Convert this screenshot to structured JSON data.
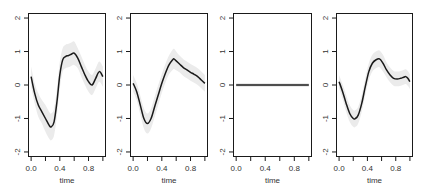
{
  "chart_data": [
    {
      "type": "line",
      "panel": 1,
      "title": "",
      "xlabel": "time",
      "ylabel": "",
      "xlim": [
        0,
        1
      ],
      "ylim": [
        -2,
        2
      ],
      "x_ticks": [
        0.0,
        0.2,
        0.4,
        0.6,
        0.8,
        1.0
      ],
      "x_tick_labels": [
        "0.0",
        "",
        "0.4",
        "",
        "0.8",
        ""
      ],
      "y_ticks": [
        -2,
        -1,
        0,
        1,
        2
      ],
      "y_tick_labels": [
        "-2",
        "-1",
        "0",
        "1",
        "2"
      ],
      "grid": false,
      "series": [
        {
          "name": "mean",
          "x": [
            0.0,
            0.05,
            0.1,
            0.15,
            0.2,
            0.25,
            0.28,
            0.32,
            0.36,
            0.4,
            0.44,
            0.48,
            0.52,
            0.56,
            0.6,
            0.65,
            0.7,
            0.75,
            0.8,
            0.85,
            0.9,
            0.95,
            1.0
          ],
          "values": [
            0.25,
            -0.25,
            -0.6,
            -0.8,
            -1.0,
            -1.2,
            -1.25,
            -1.1,
            -0.5,
            0.3,
            0.75,
            0.85,
            0.88,
            0.92,
            0.95,
            0.8,
            0.55,
            0.3,
            0.1,
            0.0,
            0.2,
            0.4,
            0.25
          ],
          "band_halfwidth": [
            0.3,
            0.3,
            0.35,
            0.35,
            0.4,
            0.4,
            0.4,
            0.4,
            0.4,
            0.4,
            0.35,
            0.35,
            0.35,
            0.35,
            0.35,
            0.3,
            0.3,
            0.3,
            0.3,
            0.3,
            0.3,
            0.3,
            0.3
          ]
        }
      ]
    },
    {
      "type": "line",
      "panel": 2,
      "title": "",
      "xlabel": "time",
      "ylabel": "",
      "xlim": [
        0,
        1
      ],
      "ylim": [
        -2,
        2
      ],
      "x_ticks": [
        0.0,
        0.2,
        0.4,
        0.6,
        0.8,
        1.0
      ],
      "x_tick_labels": [
        "0.0",
        "",
        "0.4",
        "",
        "0.8",
        ""
      ],
      "y_ticks": [
        -2,
        -1,
        0,
        1,
        2
      ],
      "y_tick_labels": [
        "-2",
        "-1",
        "0",
        "1",
        "2"
      ],
      "grid": false,
      "series": [
        {
          "name": "mean",
          "x": [
            0.0,
            0.05,
            0.1,
            0.15,
            0.2,
            0.25,
            0.3,
            0.35,
            0.4,
            0.45,
            0.5,
            0.55,
            0.57,
            0.6,
            0.65,
            0.7,
            0.75,
            0.8,
            0.85,
            0.9,
            0.95,
            1.0
          ],
          "values": [
            0.05,
            -0.2,
            -0.6,
            -1.0,
            -1.15,
            -1.0,
            -0.65,
            -0.3,
            0.05,
            0.35,
            0.6,
            0.75,
            0.78,
            0.72,
            0.62,
            0.52,
            0.45,
            0.38,
            0.32,
            0.25,
            0.15,
            0.05
          ],
          "band_halfwidth": [
            0.25,
            0.25,
            0.28,
            0.3,
            0.3,
            0.3,
            0.3,
            0.3,
            0.28,
            0.28,
            0.28,
            0.3,
            0.3,
            0.28,
            0.25,
            0.25,
            0.25,
            0.25,
            0.25,
            0.25,
            0.25,
            0.25
          ]
        }
      ]
    },
    {
      "type": "line",
      "panel": 3,
      "title": "",
      "xlabel": "time",
      "ylabel": "",
      "xlim": [
        0,
        1
      ],
      "ylim": [
        -2,
        2
      ],
      "x_ticks": [
        0.0,
        0.2,
        0.4,
        0.6,
        0.8,
        1.0
      ],
      "x_tick_labels": [
        "0.0",
        "",
        "0.4",
        "",
        "0.8",
        ""
      ],
      "y_ticks": [
        -2,
        -1,
        0,
        1,
        2
      ],
      "y_tick_labels": [
        "-2",
        "-1",
        "0",
        "1",
        "2"
      ],
      "grid": false,
      "series": [
        {
          "name": "mean",
          "x": [
            0.0,
            0.25,
            0.5,
            0.75,
            1.0
          ],
          "values": [
            0.0,
            0.0,
            0.0,
            0.0,
            0.0
          ],
          "band_halfwidth": [
            0.06,
            0.06,
            0.06,
            0.06,
            0.06
          ]
        }
      ]
    },
    {
      "type": "line",
      "panel": 4,
      "title": "",
      "xlabel": "time",
      "ylabel": "",
      "xlim": [
        0,
        1
      ],
      "ylim": [
        -2,
        2
      ],
      "x_ticks": [
        0.0,
        0.2,
        0.4,
        0.6,
        0.8,
        1.0
      ],
      "x_tick_labels": [
        "0.0",
        "",
        "0.4",
        "",
        "0.8",
        ""
      ],
      "y_ticks": [
        -2,
        -1,
        0,
        1,
        2
      ],
      "y_tick_labels": [
        "-2",
        "-1",
        "0",
        "1",
        "2"
      ],
      "grid": false,
      "series": [
        {
          "name": "mean",
          "x": [
            0.0,
            0.05,
            0.1,
            0.15,
            0.2,
            0.23,
            0.27,
            0.32,
            0.37,
            0.42,
            0.47,
            0.52,
            0.57,
            0.62,
            0.67,
            0.72,
            0.77,
            0.82,
            0.87,
            0.91,
            0.94,
            0.97,
            1.0
          ],
          "values": [
            0.1,
            -0.2,
            -0.55,
            -0.85,
            -1.0,
            -1.0,
            -0.9,
            -0.55,
            -0.05,
            0.4,
            0.65,
            0.75,
            0.78,
            0.65,
            0.45,
            0.3,
            0.2,
            0.18,
            0.2,
            0.23,
            0.25,
            0.2,
            0.1
          ],
          "band_halfwidth": [
            0.2,
            0.22,
            0.25,
            0.25,
            0.25,
            0.25,
            0.25,
            0.25,
            0.25,
            0.25,
            0.25,
            0.25,
            0.25,
            0.25,
            0.22,
            0.22,
            0.22,
            0.22,
            0.22,
            0.22,
            0.22,
            0.22,
            0.22
          ]
        }
      ]
    }
  ],
  "layout": {
    "panels": [
      {
        "left": 28,
        "right": 106,
        "top": 13,
        "bottom": 157
      },
      {
        "left": 130,
        "right": 208,
        "top": 13,
        "bottom": 157
      },
      {
        "left": 233,
        "right": 312,
        "top": 13,
        "bottom": 157
      },
      {
        "left": 336,
        "right": 413,
        "top": 13,
        "bottom": 157
      }
    ],
    "colors": {
      "line": "#1a1a1a",
      "flat_line": "#555555",
      "band": "#ebebeb",
      "axis": "#1a1a1a",
      "text": "#333333"
    }
  }
}
